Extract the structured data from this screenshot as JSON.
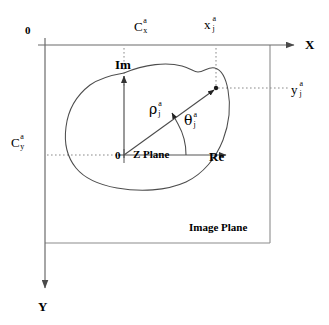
{
  "diagram": {
    "colors": {
      "stroke": "#555555",
      "text": "#000000",
      "dotted": "#777777",
      "blob": "#444444",
      "background": "#ffffff"
    },
    "labels": {
      "origin_image": "0",
      "origin_z": "0",
      "axis_x": "X",
      "axis_y": "Y",
      "axis_im": "Im",
      "axis_re": "Re",
      "z_plane": "Z Plane",
      "image_plane": "Image Plane",
      "centroid_x": {
        "base": "C",
        "sup": "a",
        "sub": "x"
      },
      "centroid_y": {
        "base": "C",
        "sup": "a",
        "sub": "y"
      },
      "point_x": {
        "base": "x",
        "sup": "a",
        "sub": "j"
      },
      "point_y": {
        "base": "y",
        "sup": "a",
        "sub": "j"
      },
      "rho": {
        "base": "ρ",
        "sup": "a",
        "sub": "j"
      },
      "theta": {
        "base": "θ",
        "sup": "a",
        "sub": "j"
      }
    },
    "geometry": {
      "image_origin": [
        45,
        45
      ],
      "image_frame_right": 270,
      "image_frame_bottom": 243,
      "z_origin": [
        124,
        155
      ],
      "point": [
        216,
        88
      ],
      "x_axis_arrow_tip": [
        296,
        45
      ],
      "y_axis_arrow_tip": [
        45,
        290
      ],
      "im_axis_arrow_tip": [
        124,
        74
      ],
      "re_axis_arrow_tip": [
        228,
        155
      ]
    }
  }
}
